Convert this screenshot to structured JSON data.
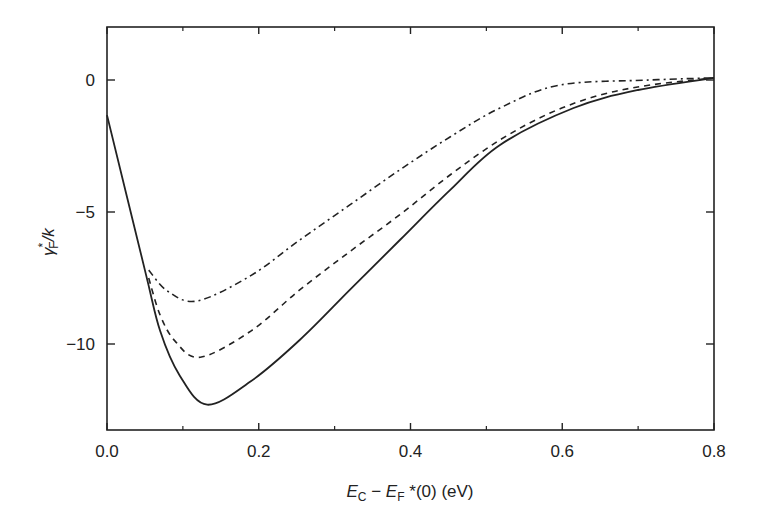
{
  "chart_data": {
    "type": "line",
    "title": "",
    "xlabel": "E_C − E_F*(0) (eV)",
    "ylabel": "γ*_F / k",
    "xlim": [
      0.0,
      0.8
    ],
    "ylim": [
      -13,
      2
    ],
    "grid": false,
    "legend": null,
    "x_ticks": {
      "major": [
        0.0,
        0.2,
        0.4,
        0.6,
        0.8
      ],
      "major_labels": [
        "0.0",
        "0.2",
        "0.4",
        "0.6",
        "0.8"
      ],
      "minor": [
        0.1,
        0.3,
        0.5,
        0.7
      ]
    },
    "y_ticks": {
      "major": [
        0,
        -5,
        -10
      ],
      "major_labels": [
        "0",
        "−5",
        "−10"
      ]
    },
    "series": [
      {
        "name": "solid",
        "style": "solid",
        "x": [
          0.0,
          0.05,
          0.07,
          0.096,
          0.132,
          0.19,
          0.254,
          0.32,
          0.386,
          0.452,
          0.518,
          0.615,
          0.7,
          0.8
        ],
        "y": [
          -1.33,
          -7.2,
          -9.5,
          -11.2,
          -12.3,
          -11.4,
          -9.85,
          -7.95,
          -6.06,
          -4.17,
          -2.46,
          -1.06,
          -0.38,
          0.08
        ]
      },
      {
        "name": "dashed",
        "style": "dashed",
        "x": [
          0.055,
          0.07,
          0.09,
          0.123,
          0.19,
          0.254,
          0.32,
          0.386,
          0.452,
          0.518,
          0.584,
          0.65,
          0.716,
          0.8
        ],
        "y": [
          -7.5,
          -8.9,
          -9.9,
          -10.5,
          -9.5,
          -7.95,
          -6.5,
          -5.1,
          -3.6,
          -2.27,
          -1.25,
          -0.57,
          -0.19,
          0.08
        ]
      },
      {
        "name": "dash-dot",
        "style": "dashdot",
        "x": [
          0.055,
          0.08,
          0.119,
          0.19,
          0.254,
          0.32,
          0.386,
          0.452,
          0.518,
          0.597,
          0.716,
          0.8
        ],
        "y": [
          -7.2,
          -8.0,
          -8.37,
          -7.4,
          -6.06,
          -4.73,
          -3.4,
          -2.16,
          -1.06,
          -0.19,
          0.0,
          0.08
        ]
      }
    ]
  },
  "labels": {
    "xlabel_E": "E",
    "xlabel_C": "C",
    "xlabel_minus": " − ",
    "xlabel_F_E": "E",
    "xlabel_F": "F",
    "xlabel_rest": " *(0) (eV)",
    "ylabel_gamma": "γ",
    "ylabel_star": "*",
    "ylabel_F": "F",
    "ylabel_rest": "/k"
  }
}
